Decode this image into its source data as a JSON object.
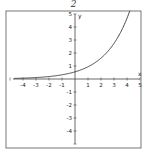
{
  "header": {
    "problem_number": "2"
  },
  "chart_data": {
    "type": "line",
    "title": "2",
    "xlabel": "x",
    "ylabel": "y",
    "xlim": [
      -5,
      5
    ],
    "ylim": [
      -5,
      5
    ],
    "grid": false,
    "legend": null,
    "x_ticks": [
      -4,
      -3,
      -2,
      -1,
      1,
      2,
      3,
      4,
      5
    ],
    "y_ticks": [
      -4,
      -3,
      -2,
      -1,
      1,
      2,
      3,
      4,
      5
    ],
    "series": [
      {
        "name": "exponential growth curve",
        "function_estimate": "y ≈ 0.55·e^(0.535x)",
        "x": [
          -5,
          -4,
          -3,
          -2,
          -1,
          0,
          1,
          2,
          3,
          4,
          4.2
        ],
        "y": [
          0.04,
          0.06,
          0.11,
          0.19,
          0.32,
          0.55,
          0.94,
          1.61,
          2.75,
          4.7,
          5.2
        ]
      }
    ],
    "frame": {
      "left": 6,
      "top": 11,
      "right": 141,
      "bottom": 148
    },
    "origin_px": {
      "x": 75,
      "y": 79
    },
    "px_per_unit": 13,
    "line_color": "#333333",
    "axis_color": "#444444",
    "frame_color": "#555555"
  }
}
